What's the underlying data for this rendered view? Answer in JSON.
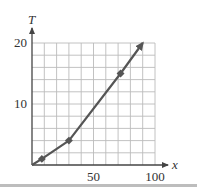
{
  "chart_data": {
    "type": "line",
    "title": "",
    "xlabel": "x",
    "ylabel": "T",
    "xlim": [
      0,
      100
    ],
    "ylim": [
      0,
      20
    ],
    "x_ticks": [
      50,
      100
    ],
    "y_ticks": [
      10,
      20
    ],
    "x_tick_labels": [
      "50",
      "100"
    ],
    "y_tick_labels": [
      "10",
      "20"
    ],
    "grid": true,
    "grid_x_step": 10,
    "grid_y_step": 2,
    "legend": null,
    "series": [
      {
        "name": "T",
        "x": [
          0,
          8,
          30,
          72,
          90
        ],
        "values": [
          0,
          1,
          4,
          15,
          20
        ],
        "marked_points": [
          [
            8,
            1
          ],
          [
            30,
            4
          ],
          [
            72,
            15
          ]
        ],
        "end_arrow": true
      }
    ],
    "colors": {
      "line": "#555555",
      "grid": "#bbbbbb",
      "axis": "#444444",
      "text": "#333333"
    }
  }
}
